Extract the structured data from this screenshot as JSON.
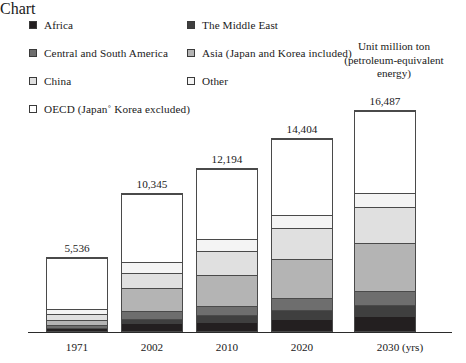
{
  "legend": {
    "items": [
      {
        "key": "africa",
        "label": "Africa",
        "color": "#231f20",
        "column": "left",
        "row": 0
      },
      {
        "key": "central_south_america",
        "label": "Central and South America",
        "color": "#6e6e6e",
        "column": "left",
        "row": 1
      },
      {
        "key": "china",
        "label": "China",
        "color": "#e0e0e0",
        "column": "left",
        "row": 2
      },
      {
        "key": "oecd",
        "label": "OECD (Japan˚ Korea excluded)",
        "color": "#ffffff",
        "column": "left",
        "row": 3
      },
      {
        "key": "middle_east",
        "label": "The Middle East",
        "color": "#3f3f3f",
        "column": "right",
        "row": 0
      },
      {
        "key": "asia",
        "label": "Asia (Japan and Korea included)",
        "color": "#b4b4b4",
        "column": "right",
        "row": 1
      },
      {
        "key": "other",
        "label": "Other",
        "color": "#f4f4f4",
        "column": "right",
        "row": 2
      }
    ]
  },
  "unit_note": {
    "line1": "Unit million ton",
    "line2": "(petroleum-equivalent",
    "line3": "energy)"
  },
  "axis": {
    "x_suffix": "(yrs)"
  },
  "chart_data": {
    "type": "bar",
    "subtype": "stacked-bar",
    "title": "",
    "xlabel": "(yrs)",
    "ylabel": "Unit million ton (petroleum-equivalent energy)",
    "grid": false,
    "legend_position": "top",
    "ylim": [
      0,
      16487
    ],
    "categories": [
      "1971",
      "2002",
      "2010",
      "2020",
      "2030"
    ],
    "totals": [
      5536,
      10345,
      12194,
      14404,
      16487
    ],
    "total_labels": [
      "5,536",
      "10,345",
      "12,194",
      "14,404",
      "16,487"
    ],
    "series": [
      {
        "name": "Africa",
        "color": "#231f20",
        "values": [
          125,
          520,
          640,
          830,
          1020
        ]
      },
      {
        "name": "The Middle East",
        "color": "#3f3f3f",
        "values": [
          115,
          410,
          560,
          760,
          960
        ]
      },
      {
        "name": "Central and South America",
        "color": "#6e6e6e",
        "values": [
          200,
          560,
          700,
          880,
          1050
        ]
      },
      {
        "name": "Asia (Japan and Korea included)",
        "color": "#b4b4b4",
        "values": [
          430,
          1770,
          2300,
          2970,
          3570
        ]
      },
      {
        "name": "China",
        "color": "#e0e0e0",
        "values": [
          390,
          1140,
          1840,
          2300,
          2720
        ]
      },
      {
        "name": "Other",
        "color": "#f4f4f4",
        "values": [
          420,
          830,
          870,
          960,
          1040
        ]
      },
      {
        "name": "OECD (Japan˚ Korea excluded)",
        "color": "#ffffff",
        "values": [
          3856,
          5115,
          5284,
          5704,
          6127
        ]
      }
    ]
  }
}
